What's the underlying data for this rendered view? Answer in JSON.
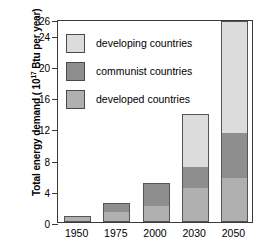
{
  "chart_data": {
    "type": "bar",
    "stacked": true,
    "title": "",
    "xlabel": "",
    "ylabel": "Total energy demand (10¹⁷ Btu per year)",
    "ylabel_base": "Total energy demand ( 10",
    "ylabel_exponent": "17",
    "ylabel_tail": " Btu per year)",
    "categories": [
      "1950",
      "1975",
      "2000",
      "2030",
      "2050"
    ],
    "ylim": [
      0,
      26
    ],
    "yticks": [
      0,
      4,
      8,
      12,
      16,
      20,
      24,
      26
    ],
    "ytick_labels": [
      "0",
      "4",
      "8",
      "12",
      "16",
      "20",
      "24",
      "26"
    ],
    "grid": false,
    "legend_position": "upper-left-inside",
    "series": [
      {
        "name": "developed countries",
        "color": "#b0b0b0",
        "values": [
          0.8,
          1.3,
          2.0,
          4.4,
          5.6
        ]
      },
      {
        "name": "communist countries",
        "color": "#8e8e8e",
        "values": [
          0.0,
          1.2,
          3.0,
          2.7,
          5.8
        ]
      },
      {
        "name": "developing countries",
        "color": "#dcdcdc",
        "values": [
          0.0,
          0.0,
          0.0,
          6.7,
          14.4
        ]
      }
    ],
    "totals": [
      0.8,
      2.5,
      5.0,
      13.8,
      25.8
    ]
  },
  "legend": {
    "items": [
      {
        "label": "developing countries",
        "color": "#dcdcdc"
      },
      {
        "label": "communist countries",
        "color": "#8e8e8e"
      },
      {
        "label": "developed countries",
        "color": "#b0b0b0"
      }
    ]
  },
  "colors": {
    "developing": "#dcdcdc",
    "communist": "#8e8e8e",
    "developed": "#b0b0b0",
    "axis": "#3a3a3a",
    "background": "#ffffff",
    "text": "#000000"
  }
}
